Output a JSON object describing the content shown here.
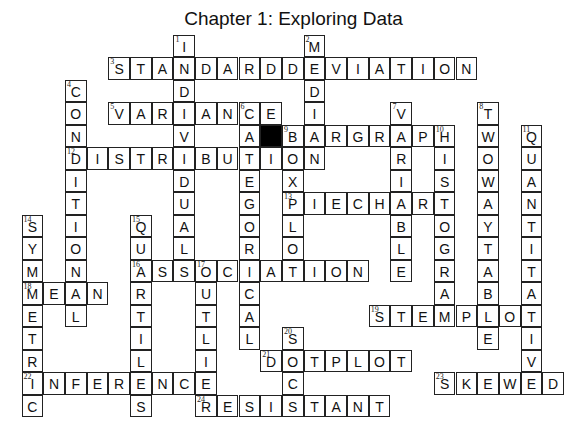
{
  "title": "Chapter 1: Exploring Data",
  "grid": {
    "origin_x": 22,
    "origin_y": 35,
    "cell_w": 21.7,
    "cell_h": 22.5,
    "black_cells": [
      {
        "row": 4,
        "col": 11
      }
    ]
  },
  "words": [
    {
      "number": "1",
      "direction": "down",
      "answer": "INDIVIDUAL",
      "row": 0,
      "col": 7
    },
    {
      "number": "2",
      "direction": "down",
      "answer": "MEDIAN",
      "row": 0,
      "col": 13
    },
    {
      "number": "3",
      "direction": "across",
      "answer": "STANDARDDEVIATION",
      "row": 1,
      "col": 4
    },
    {
      "number": "4",
      "direction": "down",
      "answer": "CONDITIONAL",
      "row": 2,
      "col": 2
    },
    {
      "number": "5",
      "direction": "across",
      "answer": "VARIANCE",
      "row": 3,
      "col": 4
    },
    {
      "number": "6",
      "direction": "down",
      "answer": "CATEGORICAL",
      "row": 3,
      "col": 10
    },
    {
      "number": "7",
      "direction": "down",
      "answer": "VARIABLE",
      "row": 3,
      "col": 17
    },
    {
      "number": "8",
      "direction": "down",
      "answer": "TWOWAYTABLE",
      "row": 3,
      "col": 21
    },
    {
      "number": "9",
      "direction": "across",
      "answer": "BARGRAPH",
      "row": 4,
      "col": 12
    },
    {
      "number": "9",
      "direction": "down",
      "answer": "BOXPLOT",
      "row": 4,
      "col": 12
    },
    {
      "number": "10",
      "direction": "down",
      "answer": "HISTOGRAM",
      "row": 4,
      "col": 19
    },
    {
      "number": "11",
      "direction": "down",
      "answer": "QUANTITATIVE",
      "row": 4,
      "col": 23
    },
    {
      "number": "12",
      "direction": "across",
      "answer": "DISTRIBUTION",
      "row": 5,
      "col": 2
    },
    {
      "number": "13",
      "direction": "across",
      "answer": "PIECHART",
      "row": 7,
      "col": 12
    },
    {
      "number": "14",
      "direction": "down",
      "answer": "SYMMETRIC",
      "row": 8,
      "col": 0
    },
    {
      "number": "15",
      "direction": "down",
      "answer": "QUARTILES",
      "row": 8,
      "col": 5
    },
    {
      "number": "16",
      "direction": "across",
      "answer": "ASSOCIATION",
      "row": 10,
      "col": 5
    },
    {
      "number": "17",
      "direction": "down",
      "answer": "OUTLIER",
      "row": 10,
      "col": 8
    },
    {
      "number": "18",
      "direction": "across",
      "answer": "MEAN",
      "row": 11,
      "col": 0
    },
    {
      "number": "19",
      "direction": "across",
      "answer": "STEMPLOT",
      "row": 12,
      "col": 16
    },
    {
      "number": "20",
      "direction": "down",
      "answer": "SOCS",
      "row": 13,
      "col": 12
    },
    {
      "number": "21",
      "direction": "across",
      "answer": "DOTPLOT",
      "row": 14,
      "col": 11
    },
    {
      "number": "22",
      "direction": "across",
      "answer": "INFERENCE",
      "row": 15,
      "col": 0
    },
    {
      "number": "23",
      "direction": "across",
      "answer": "SKEWED",
      "row": 15,
      "col": 19
    },
    {
      "number": "24",
      "direction": "across",
      "answer": "RESISTANT",
      "row": 16,
      "col": 8
    }
  ]
}
